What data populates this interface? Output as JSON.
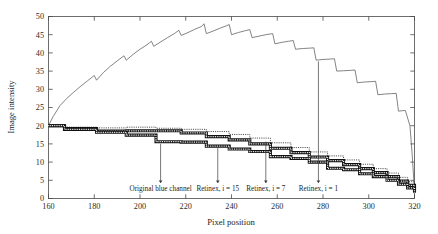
{
  "chart_data": {
    "type": "line",
    "title": "",
    "xlabel": "Pixel position",
    "ylabel": "Image intensity",
    "xlim": [
      160,
      320
    ],
    "ylim": [
      0,
      50
    ],
    "xticks": [
      160,
      180,
      200,
      220,
      240,
      260,
      280,
      300,
      320
    ],
    "xtick_labels": [
      "160",
      "180",
      "200",
      "220",
      "240",
      "260",
      "280",
      "300",
      "320"
    ],
    "yticks": [
      0,
      5,
      10,
      15,
      20,
      25,
      30,
      35,
      40,
      45,
      50
    ],
    "ytick_labels": [
      "0",
      "5",
      "10",
      "15",
      "20",
      "25",
      "30",
      "35",
      "40",
      "45",
      "50"
    ],
    "grid": false,
    "legend": "none (inline annotations with arrows)",
    "series": [
      {
        "name": "Retinex, i = 1",
        "style": "solid-thin",
        "color": "#5b5b5b",
        "description": "Upper sawtooth staircase rising from 20 to a peak near 48 around pixel 230, then descending in steps to ~2 at pixel 320",
        "x": [
          160,
          162,
          165,
          168,
          171,
          174,
          177,
          180,
          181,
          184,
          187,
          190,
          193,
          194,
          197,
          200,
          203,
          205,
          206,
          209,
          212,
          215,
          217,
          218,
          221,
          224,
          227,
          228,
          229,
          232,
          235,
          238,
          239,
          240,
          243,
          246,
          248,
          249,
          252,
          255,
          258,
          259,
          262,
          265,
          267,
          268,
          271,
          274,
          276,
          277,
          280,
          283,
          285,
          286,
          289,
          292,
          294,
          295,
          298,
          301,
          303,
          304,
          307,
          310,
          312,
          313,
          316,
          318,
          319,
          320
        ],
        "y": [
          20.0,
          22.5,
          25.5,
          27.5,
          29.2,
          30.8,
          32.3,
          33.8,
          32.5,
          34.6,
          36.3,
          37.8,
          39.2,
          38.0,
          39.6,
          41.0,
          42.2,
          43.2,
          41.8,
          43.0,
          44.2,
          45.3,
          46.2,
          44.8,
          45.6,
          46.5,
          47.3,
          48.0,
          45.3,
          46.0,
          46.8,
          47.5,
          47.8,
          45.0,
          45.6,
          46.1,
          46.4,
          44.2,
          44.6,
          45.0,
          45.3,
          42.5,
          42.9,
          43.2,
          43.4,
          41.0,
          41.2,
          41.3,
          41.4,
          38.0,
          38.2,
          38.3,
          38.4,
          35.0,
          35.1,
          35.2,
          35.3,
          31.8,
          32.0,
          32.1,
          32.2,
          28.5,
          28.7,
          28.8,
          28.9,
          24.0,
          24.2,
          20.0,
          12.0,
          2.0
        ]
      },
      {
        "name": "Retinex, i = 7",
        "style": "dotted",
        "color": "#3a3a3a",
        "description": "Dotted staircase starting at 20, declining gently to ~17 by pixel 230, then stepping down to ~3 at pixel 320; sits above the two thick curves",
        "x": [
          160,
          166,
          167,
          180,
          181,
          193,
          194,
          206,
          207,
          217,
          218,
          228,
          229,
          238,
          239,
          247,
          248,
          256,
          257,
          265,
          266,
          273,
          274,
          281,
          282,
          288,
          289,
          295,
          296,
          301,
          302,
          307,
          308,
          312,
          313,
          316,
          317,
          319,
          320
        ],
        "y": [
          20.0,
          20.0,
          19.6,
          19.6,
          19.4,
          19.4,
          19.6,
          19.6,
          19.3,
          19.3,
          19.0,
          19.0,
          18.4,
          18.4,
          17.6,
          17.6,
          16.6,
          16.6,
          15.3,
          15.3,
          14.0,
          14.0,
          12.8,
          12.8,
          11.7,
          11.7,
          10.6,
          10.6,
          9.4,
          9.4,
          8.2,
          8.2,
          7.0,
          7.0,
          5.8,
          5.8,
          4.6,
          4.6,
          3.0
        ]
      },
      {
        "name": "Retinex, i = 15",
        "style": "thick-hatched",
        "color": "#111111",
        "description": "Upper thick hatched staircase, starts at 20, falls in steps to ~2 at pixel 320",
        "x": [
          160,
          166,
          167,
          180,
          181,
          193,
          194,
          206,
          207,
          217,
          218,
          228,
          229,
          238,
          239,
          247,
          248,
          256,
          257,
          265,
          266,
          273,
          274,
          281,
          282,
          288,
          289,
          295,
          296,
          301,
          302,
          307,
          308,
          312,
          313,
          316,
          317,
          319,
          320
        ],
        "y": [
          20.0,
          20.0,
          19.2,
          19.2,
          18.5,
          18.5,
          18.6,
          18.6,
          18.6,
          18.6,
          18.0,
          18.0,
          17.0,
          17.0,
          16.1,
          16.1,
          15.0,
          15.0,
          13.8,
          13.8,
          12.6,
          12.6,
          11.4,
          11.4,
          10.4,
          10.4,
          9.3,
          9.3,
          8.2,
          8.2,
          7.1,
          7.1,
          6.0,
          6.0,
          4.8,
          4.8,
          3.6,
          3.6,
          2.2
        ]
      },
      {
        "name": "Original blue channel",
        "style": "thick-hatched",
        "color": "#111111",
        "description": "Lower thick hatched staircase, starts at 20, offset ~1.5 below the Retinex i=15 trace, ends near 1.8 at pixel 320",
        "x": [
          160,
          166,
          167,
          180,
          181,
          193,
          194,
          206,
          207,
          217,
          218,
          228,
          229,
          238,
          239,
          247,
          248,
          256,
          257,
          265,
          266,
          273,
          274,
          281,
          282,
          288,
          289,
          295,
          296,
          301,
          302,
          307,
          308,
          312,
          313,
          316,
          317,
          319,
          320
        ],
        "y": [
          20.0,
          20.0,
          19.0,
          19.0,
          18.2,
          18.2,
          17.4,
          17.4,
          15.6,
          15.6,
          15.5,
          15.5,
          14.4,
          14.4,
          13.6,
          13.6,
          12.9,
          12.9,
          11.5,
          11.5,
          11.0,
          11.0,
          10.0,
          10.0,
          8.3,
          8.3,
          7.9,
          7.9,
          6.8,
          6.8,
          6.0,
          6.0,
          5.0,
          5.0,
          3.9,
          3.9,
          2.9,
          2.9,
          1.6
        ]
      }
    ],
    "annotations": [
      {
        "label": "Original blue channel",
        "arrow_x": 209,
        "arrow_tip_y": 15.6,
        "text_anchor_x": 209
      },
      {
        "label": "Retinex, i = 15",
        "arrow_x": 234,
        "arrow_tip_y": 14.4,
        "text_anchor_x": 234
      },
      {
        "label": "Retinex, i = 7",
        "arrow_x": 255,
        "arrow_tip_y": 16.2,
        "text_anchor_x": 255
      },
      {
        "label": "Retinex, i = 1",
        "arrow_x": 278,
        "arrow_tip_y": 38.2,
        "text_anchor_x": 278
      }
    ]
  }
}
